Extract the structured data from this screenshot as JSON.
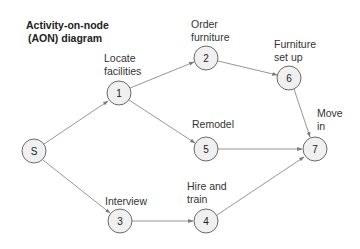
{
  "title": {
    "line1": "Activity-on-node",
    "line2": "(AON) diagram"
  },
  "nodes": [
    {
      "id": "S",
      "label": "S",
      "x": 34,
      "y": 151,
      "r": 12,
      "activity": []
    },
    {
      "id": "1",
      "label": "1",
      "x": 119,
      "y": 93,
      "r": 12,
      "activity": [
        "Locate",
        "facilities"
      ]
    },
    {
      "id": "2",
      "label": "2",
      "x": 206,
      "y": 58,
      "r": 12,
      "activity": [
        "Order",
        "furniture"
      ]
    },
    {
      "id": "3",
      "label": "3",
      "x": 120,
      "y": 221,
      "r": 12,
      "activity": [
        "Interview"
      ]
    },
    {
      "id": "4",
      "label": "4",
      "x": 206,
      "y": 221,
      "r": 12,
      "activity": [
        "Hire and",
        "train"
      ]
    },
    {
      "id": "5",
      "label": "5",
      "x": 206,
      "y": 149,
      "r": 12,
      "activity": [
        "Remodel"
      ]
    },
    {
      "id": "6",
      "label": "6",
      "x": 289,
      "y": 78,
      "r": 12,
      "activity": [
        "Furniture",
        "set up"
      ]
    },
    {
      "id": "7",
      "label": "7",
      "x": 315,
      "y": 149,
      "r": 12,
      "activity": [
        "Move",
        "in"
      ]
    }
  ],
  "edges": [
    {
      "from": "S",
      "to": "1"
    },
    {
      "from": "S",
      "to": "3"
    },
    {
      "from": "1",
      "to": "2"
    },
    {
      "from": "1",
      "to": "5"
    },
    {
      "from": "2",
      "to": "6"
    },
    {
      "from": "6",
      "to": "7"
    },
    {
      "from": "5",
      "to": "7"
    },
    {
      "from": "3",
      "to": "4"
    },
    {
      "from": "4",
      "to": "7"
    }
  ],
  "labels": {
    "n1": {
      "line1": "Locate",
      "line2": "facilities"
    },
    "n2": {
      "line1": "Order",
      "line2": "furniture"
    },
    "n3": {
      "line1": "Interview"
    },
    "n4": {
      "line1": "Hire and",
      "line2": "train"
    },
    "n5": {
      "line1": "Remodel"
    },
    "n6": {
      "line1": "Furniture",
      "line2": "set up"
    },
    "n7": {
      "line1": "Move",
      "line2": "in"
    }
  },
  "colors": {
    "node_fill": "#f0f0f0",
    "node_stroke": "#6a6a6a",
    "edge": "#8a8a8a",
    "text": "#333333",
    "background": "#ffffff"
  }
}
